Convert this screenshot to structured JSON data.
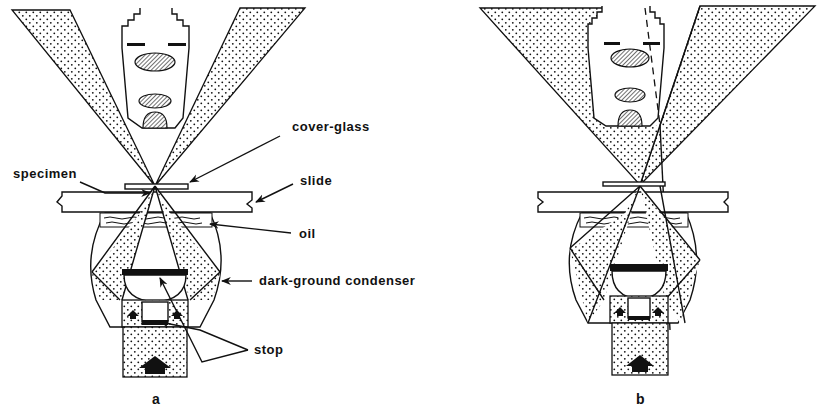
{
  "figure": {
    "panels": [
      {
        "id": "a",
        "caption": "a",
        "labels": {
          "cover_glass": "cover-glass",
          "specimen": "specimen",
          "slide": "slide",
          "oil": "oil",
          "condenser": "dark-ground condenser",
          "stop": "stop"
        }
      },
      {
        "id": "b",
        "caption": "b"
      }
    ]
  },
  "colors": {
    "ink": "#111111",
    "background": "#ffffff"
  }
}
